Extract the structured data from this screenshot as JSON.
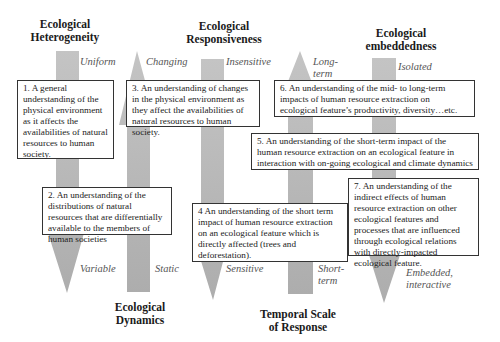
{
  "colors": {
    "arrow_fill": "#b7b7b7",
    "box_border": "#333333",
    "pole_text": "#555555"
  },
  "dimensions": [
    {
      "id": "heterogeneity",
      "heading": "Ecological Heterogeneity",
      "heading_lines": [
        "Ecological",
        "Heterogeneity"
      ],
      "top_pole": "Uniform",
      "bottom_pole": "Variable",
      "arrow_direction": "down"
    },
    {
      "id": "dynamics",
      "heading": "Ecological Dynamics",
      "heading_lines": [
        "Ecological",
        "Dynamics"
      ],
      "top_pole": "Changing",
      "bottom_pole": "Static",
      "arrow_direction": "up"
    },
    {
      "id": "responsiveness",
      "heading": "Ecological Responsiveness",
      "heading_lines": [
        "Ecological",
        "Responsiveness"
      ],
      "top_pole": "Insensitive",
      "bottom_pole": "Sensitive",
      "arrow_direction": "down"
    },
    {
      "id": "temporal",
      "heading": "Temporal Scale of Response",
      "heading_lines": [
        "Temporal Scale",
        "of Response"
      ],
      "top_pole": "Long-term",
      "top_pole_lines": [
        "Long-",
        "term"
      ],
      "bottom_pole": "Short-term",
      "bottom_pole_lines": [
        "Short-",
        "term"
      ],
      "arrow_direction": "up"
    },
    {
      "id": "embeddedness",
      "heading": "Ecological embeddedness",
      "heading_lines": [
        "Ecological",
        "embeddedness"
      ],
      "top_pole": "Isolated",
      "bottom_pole": "Embedded, interactive",
      "bottom_pole_lines": [
        "Embedded,",
        "interactive"
      ],
      "arrow_direction": "down"
    }
  ],
  "boxes": [
    {
      "n": "1",
      "text": "1.  A general understanding of the physical environment as it affects the availabilities of natural resources to human society."
    },
    {
      "n": "2",
      "text": "2. An understanding of the distributions of natural resources that are differentially available to the members of human societies"
    },
    {
      "n": "3",
      "text": "3. An understanding of changes in the physical environment as they affect the availabilities of natural resources to human society."
    },
    {
      "n": "4",
      "text": "4 An understanding of the short term impact of human resource extraction on an ecological feature which is directly affected (trees and deforestation)."
    },
    {
      "n": "5",
      "text": "5. An understanding of the short-term impact of the human resource extraction on an ecological feature in interaction with on-going ecological and climate dynamics"
    },
    {
      "n": "6",
      "text": "6. An understanding of the mid- to long-term impacts of human resource extraction on ecological feature’s productivity, diversity…etc."
    },
    {
      "n": "7",
      "text": "7. An understanding of the indirect effects of human resource extraction on other ecological features and processes that are influenced through ecological relations with directly-impacted ecological feature."
    }
  ]
}
